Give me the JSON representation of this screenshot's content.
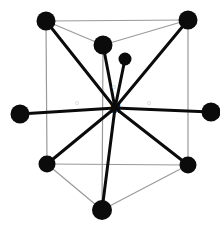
{
  "figure": {
    "background": "#ffffff",
    "width": 220,
    "height": 229,
    "colors": {
      "vertex_fill": "#0b0b0b",
      "bond_stroke": "#0b0b0b",
      "cage_stroke": "#9a9a9a",
      "label_center": "#0b0b0b",
      "label_ligand": "#d2d2d2"
    },
    "center_atom": {
      "label": "M",
      "x": 115,
      "y": 108,
      "marker": "·"
    },
    "vertices": [
      {
        "name": "top-left",
        "x": 46,
        "y": 21,
        "r": 9.5
      },
      {
        "name": "top-middle",
        "x": 103,
        "y": 45,
        "r": 9.5
      },
      {
        "name": "top-right",
        "x": 188,
        "y": 20,
        "r": 9.5
      },
      {
        "name": "left",
        "x": 20,
        "y": 114,
        "r": 9.5
      },
      {
        "name": "right",
        "x": 211,
        "y": 112,
        "r": 9.5
      },
      {
        "name": "bottom-left",
        "x": 47,
        "y": 164,
        "r": 8.5
      },
      {
        "name": "bottom-right",
        "x": 188,
        "y": 165,
        "r": 8.5
      },
      {
        "name": "bottom-middle",
        "x": 102,
        "y": 210,
        "r": 10
      },
      {
        "name": "extra-ligand",
        "x": 125,
        "y": 59,
        "r": 6.5
      }
    ],
    "bonds": [
      {
        "from": "center",
        "to": "top-left",
        "width": 3.0
      },
      {
        "from": "center",
        "to": "top-middle",
        "width": 3.0
      },
      {
        "from": "center",
        "to": "top-right",
        "width": 3.0
      },
      {
        "from": "center",
        "to": "left",
        "width": 3.0
      },
      {
        "from": "center",
        "to": "right",
        "width": 3.0
      },
      {
        "from": "center",
        "to": "bottom-left",
        "width": 3.0
      },
      {
        "from": "center",
        "to": "bottom-right",
        "width": 3.0
      },
      {
        "from": "center",
        "to": "bottom-middle",
        "width": 3.0
      },
      {
        "from": "center",
        "to": "extra-ligand",
        "width": 3.0
      }
    ],
    "cage_edges": [
      {
        "from": "top-left",
        "to": "top-right",
        "width": 1.2
      },
      {
        "from": "top-left",
        "to": "top-middle",
        "width": 1.2
      },
      {
        "from": "top-right",
        "to": "top-middle",
        "width": 1.2
      },
      {
        "from": "top-left",
        "to": "bottom-left",
        "width": 1.2
      },
      {
        "from": "top-right",
        "to": "bottom-right",
        "width": 1.2
      },
      {
        "from": "top-middle",
        "to": "bottom-middle",
        "width": 1.2
      },
      {
        "from": "bottom-left",
        "to": "bottom-right",
        "width": 1.2
      },
      {
        "from": "bottom-left",
        "to": "bottom-middle",
        "width": 1.2
      },
      {
        "from": "bottom-right",
        "to": "bottom-middle",
        "width": 1.2
      }
    ],
    "ligand_labels": [
      {
        "name": "label-left",
        "text": "o",
        "x": 75,
        "y": 99
      },
      {
        "name": "label-right",
        "text": "o",
        "x": 147,
        "y": 99
      },
      {
        "name": "label-upper",
        "text": "o",
        "x": 112,
        "y": 83
      }
    ]
  }
}
